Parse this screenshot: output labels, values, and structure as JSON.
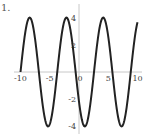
{
  "problem_label": "1.",
  "chart_data": {
    "type": "line",
    "title": "",
    "xlabel": "",
    "ylabel": "",
    "xlim": [
      -10,
      10
    ],
    "ylim": [
      -4.5,
      4.5
    ],
    "x_ticks": [
      "-10",
      "-5",
      "0",
      "5",
      "10"
    ],
    "y_ticks": [
      "4",
      "2",
      "-2",
      "-4"
    ],
    "grid": false,
    "legend": null,
    "series": [
      {
        "name": "curve",
        "function": "4*sin(x+10)",
        "amplitude": 4,
        "period": 6.28,
        "peaks_x": [
          -8.4,
          -2.1,
          4.1,
          10.0
        ],
        "troughs_x": [
          -5.3,
          1.0,
          7.3
        ],
        "start": [
          -10,
          0
        ],
        "color": "#222222"
      }
    ]
  }
}
